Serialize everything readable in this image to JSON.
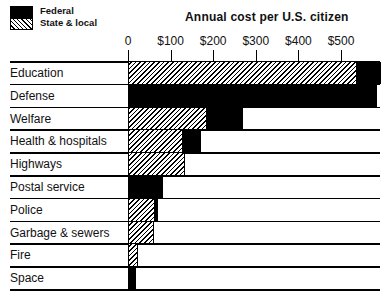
{
  "chart_data": {
    "type": "bar",
    "stacked": true,
    "orientation": "horizontal",
    "title": "Annual cost per U.S. citizen",
    "xlabel": "",
    "ylabel": "",
    "xlim": [
      0,
      600
    ],
    "x_ticks": [
      "0",
      "$100",
      "$200",
      "$300",
      "$400",
      "$500"
    ],
    "legend": [
      "Federal",
      "State & local"
    ],
    "legend_position": "top-left",
    "grid": false,
    "categories": [
      "Education",
      "Defense",
      "Welfare",
      "Health & hospitals",
      "Highways",
      "Postal service",
      "Police",
      "Garbage & sewers",
      "Fire",
      "Space"
    ],
    "series": [
      {
        "name": "State & local",
        "values": [
          538,
          0,
          185,
          129,
          134,
          0,
          63,
          61,
          23,
          0
        ]
      },
      {
        "name": "Federal",
        "values": [
          56,
          585,
          85,
          42,
          0,
          82,
          7,
          0,
          0,
          19
        ]
      }
    ]
  },
  "legend": {
    "federal_label": "Federal",
    "state_label": "State & local"
  },
  "header": {
    "title": "Annual cost per U.S. citizen"
  },
  "axis": {
    "ticks": [
      "0",
      "$100",
      "$200",
      "$300",
      "$400",
      "$500"
    ]
  },
  "rows": [
    {
      "label": "Education"
    },
    {
      "label": "Defense"
    },
    {
      "label": "Welfare"
    },
    {
      "label": "Health & hospitals"
    },
    {
      "label": "Highways"
    },
    {
      "label": "Postal service"
    },
    {
      "label": "Police"
    },
    {
      "label": "Garbage & sewers"
    },
    {
      "label": "Fire"
    },
    {
      "label": "Space"
    }
  ]
}
